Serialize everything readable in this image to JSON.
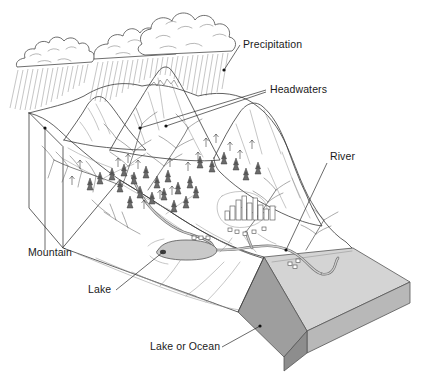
{
  "diagram": {
    "background_color": "#ffffff",
    "ink_color": "#333333",
    "labels": [
      {
        "id": "precipitation",
        "text": "Precipitation",
        "x": 243,
        "y": 48
      },
      {
        "id": "headwaters",
        "text": "Headwaters",
        "x": 270,
        "y": 90
      },
      {
        "id": "river",
        "text": "River",
        "x": 330,
        "y": 160
      },
      {
        "id": "mountain",
        "text": "Mountain",
        "x": 28,
        "y": 256
      },
      {
        "id": "lake",
        "text": "Lake",
        "x": 88,
        "y": 293
      },
      {
        "id": "lake-or-ocean",
        "text": "Lake or Ocean",
        "x": 150,
        "y": 350
      }
    ],
    "features": {
      "clouds": {
        "count": 3,
        "fill": "#ffffff",
        "stroke": "#4a4a4a"
      },
      "rain": {
        "style": "diagonal hatch lines",
        "color": "#808080"
      },
      "mountains": {
        "count": 3,
        "fill": "#ffffff"
      },
      "forest": {
        "symbol": "conifer",
        "color": "#6b6b6b"
      },
      "lake": {
        "fill": "#c9c9c9",
        "stroke": "#555555"
      },
      "ocean": {
        "top_fill": "#d4d4d4",
        "side_fill": "#b4b4b4",
        "front_fill": "#9a9a9a",
        "stroke": "#555555"
      },
      "city": {
        "buildings": 12,
        "fill": "#ffffff",
        "stroke": "#4a4a4a"
      },
      "river": {
        "band_color": "#6e6e6e",
        "core_color": "#cfcfcf"
      }
    }
  }
}
